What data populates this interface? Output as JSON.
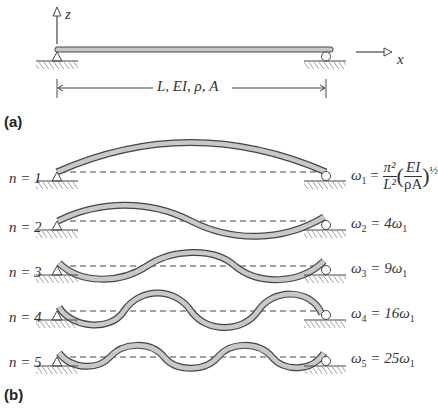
{
  "panel_a": {
    "label": "(a)",
    "axis_z": "z",
    "axis_x": "x",
    "dimension_label": "L, EI, ρ,  A"
  },
  "panel_b": {
    "label": "(b)",
    "modes": [
      {
        "n_label": "n = 1",
        "freq_prefix": "ω",
        "freq_sub": "1",
        "freq_eq": "=",
        "freq_expr": "π²/L² (EI/ρA)^½",
        "pi2": "π²",
        "L2": "L²",
        "EI": "EI",
        "rhoA": "ρA",
        "exp": "½"
      },
      {
        "n_label": "n = 2",
        "freq_prefix": "ω",
        "freq_sub": "2",
        "freq_eq": "= 4ω",
        "freq_tail_sub": "1"
      },
      {
        "n_label": "n = 3",
        "freq_prefix": "ω",
        "freq_sub": "3",
        "freq_eq": "= 9ω",
        "freq_tail_sub": "1"
      },
      {
        "n_label": "n = 4",
        "freq_prefix": "ω",
        "freq_sub": "4",
        "freq_eq": "= 16ω",
        "freq_tail_sub": "1"
      },
      {
        "n_label": "n = 5",
        "freq_prefix": "ω",
        "freq_sub": "5",
        "freq_eq": "= 25ω",
        "freq_tail_sub": "1"
      }
    ]
  },
  "colors": {
    "line": "#444444",
    "beam_fill": "#c8c8c8",
    "text": "#333333"
  }
}
